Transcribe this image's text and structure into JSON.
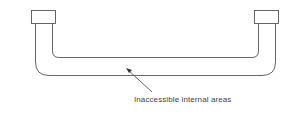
{
  "diagram": {
    "type": "u-shaped-pipe",
    "label": "Inaccessible internal areas",
    "stroke_color": "#555555"
  }
}
